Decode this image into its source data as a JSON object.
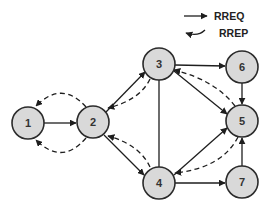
{
  "legend": {
    "rreq_label": "RREQ",
    "rrep_label": "RREP"
  },
  "colors": {
    "node_fill": "#d9d9d9",
    "node_stroke": "#2b2b2b",
    "edge": "#1e1e1e"
  },
  "nodes": [
    {
      "id": "1",
      "label": "1",
      "x": 28,
      "y": 123
    },
    {
      "id": "2",
      "label": "2",
      "x": 93,
      "y": 122
    },
    {
      "id": "3",
      "label": "3",
      "x": 159,
      "y": 64
    },
    {
      "id": "4",
      "label": "4",
      "x": 159,
      "y": 183
    },
    {
      "id": "5",
      "label": "5",
      "x": 242,
      "y": 121
    },
    {
      "id": "6",
      "label": "6",
      "x": 242,
      "y": 67
    },
    {
      "id": "7",
      "label": "7",
      "x": 242,
      "y": 182
    }
  ],
  "edges": {
    "rreq": [
      {
        "from": "1",
        "to": "2"
      },
      {
        "from": "2",
        "to": "3"
      },
      {
        "from": "2",
        "to": "4"
      },
      {
        "from": "3",
        "to": "6"
      },
      {
        "from": "3",
        "to": "5"
      },
      {
        "from": "6",
        "to": "5"
      },
      {
        "from": "4",
        "to": "5"
      },
      {
        "from": "4",
        "to": "7"
      },
      {
        "from": "7",
        "to": "5"
      }
    ],
    "undirected": [
      {
        "from": "3",
        "to": "4"
      }
    ],
    "rrep": [
      {
        "from": "2",
        "to": "1",
        "side": "upper"
      },
      {
        "from": "2",
        "to": "1",
        "side": "lower"
      },
      {
        "from": "3",
        "to": "2"
      },
      {
        "from": "4",
        "to": "2"
      },
      {
        "from": "5",
        "to": "3"
      },
      {
        "from": "5",
        "to": "4"
      }
    ]
  }
}
